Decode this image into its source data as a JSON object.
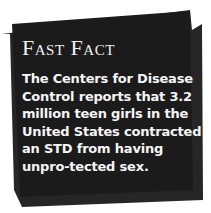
{
  "fast_fact": {
    "title": "Fast Fact",
    "body": "The Centers for Disease Control reports that 3.2 million teen girls in the United States contracted an STD from having unpro-tected sex."
  },
  "colors": {
    "card_front": "#1b1b1b",
    "card_back": "#262626",
    "text": "#f5f5f5",
    "background": "#ffffff"
  }
}
